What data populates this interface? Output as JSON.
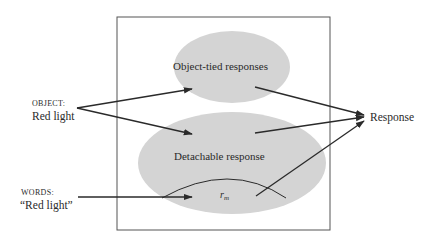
{
  "diagram": {
    "inputs": {
      "object": {
        "heading": "OBJECT:",
        "label": "Red light"
      },
      "words": {
        "heading": "WORDS:",
        "label": "“Red light”"
      }
    },
    "nodes": {
      "object_tied": "Object-tied responses",
      "detachable": "Detachable response",
      "rm_base": "r",
      "rm_sub": "m",
      "response": "Response"
    },
    "colors": {
      "ellipse_fill": "#d4d4d4",
      "line": "#2a2a2a",
      "box_stroke": "#555555"
    }
  }
}
